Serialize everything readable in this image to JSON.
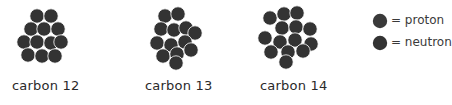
{
  "colors": {
    "proton": "#3a3a3a",
    "neutron": "#333333",
    "background": "#ffffff",
    "text": "#2a2a2a"
  },
  "isotopes": [
    {
      "label": "carbon 12",
      "label_pos": [
        12,
        80
      ],
      "nucleons": [
        [
          37,
          16
        ],
        [
          51,
          16
        ],
        [
          31,
          29
        ],
        [
          44,
          29
        ],
        [
          58,
          29
        ],
        [
          24,
          42
        ],
        [
          37,
          42
        ],
        [
          51,
          43
        ],
        [
          61,
          42
        ],
        [
          28,
          55
        ],
        [
          42,
          56
        ],
        [
          55,
          56
        ]
      ]
    },
    {
      "label": "carbon 13",
      "label_pos": [
        145,
        80
      ],
      "nucleons": [
        [
          165,
          16
        ],
        [
          178,
          14
        ],
        [
          161,
          29
        ],
        [
          174,
          30
        ],
        [
          186,
          28
        ],
        [
          195,
          33
        ],
        [
          157,
          43
        ],
        [
          171,
          45
        ],
        [
          185,
          42
        ],
        [
          163,
          56
        ],
        [
          177,
          54
        ],
        [
          191,
          50
        ],
        [
          176,
          63
        ]
      ]
    },
    {
      "label": "carbon 14",
      "label_pos": [
        260,
        80
      ],
      "nucleons": [
        [
          270,
          18
        ],
        [
          284,
          14
        ],
        [
          297,
          13
        ],
        [
          282,
          28
        ],
        [
          296,
          27
        ],
        [
          310,
          29
        ],
        [
          265,
          38
        ],
        [
          280,
          42
        ],
        [
          295,
          40
        ],
        [
          311,
          44
        ],
        [
          271,
          52
        ],
        [
          288,
          52
        ],
        [
          303,
          51
        ],
        [
          286,
          62
        ]
      ]
    }
  ],
  "legend": {
    "items": [
      {
        "symbol": "proton-circle",
        "text": "= proton",
        "cx": 380,
        "cy": 21
      },
      {
        "symbol": "neutron-circle",
        "text": "= neutron",
        "cx": 380,
        "cy": 43
      }
    ]
  },
  "nucleon_radius": 7.2
}
